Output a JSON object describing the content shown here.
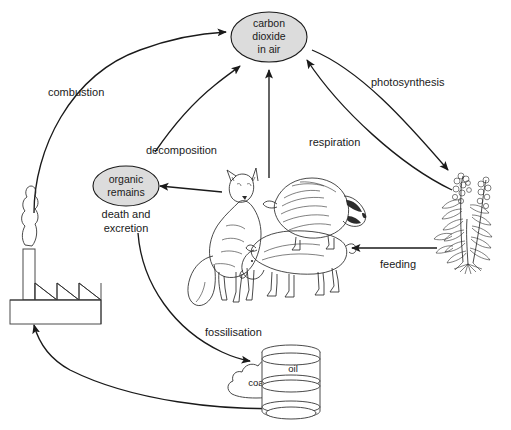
{
  "diagram": {
    "type": "cycle-diagram",
    "canvas": {
      "width": 511,
      "height": 430,
      "background": "#ffffff"
    },
    "colors": {
      "node_fill": "#dcdcdc",
      "stroke": "#1a1a1a",
      "artwork_stroke": "#2b2b2b",
      "object_fill": "#ffffff"
    }
  },
  "nodes": {
    "carbon_dioxide": {
      "line1": "carbon",
      "line2": "dioxide",
      "line3": "in air",
      "shape": "ellipse"
    },
    "organic_remains": {
      "line1": "organic",
      "line2": "remains",
      "shape": "ellipse"
    }
  },
  "labels": {
    "combustion": "combustion",
    "decomposition": "decomposition",
    "photosynthesis": "photosynthesis",
    "respiration": "respiration",
    "feeding": "feeding",
    "fossilisation": "fossilisation",
    "death_line1": "death and",
    "death_line2": "excretion"
  },
  "objects": {
    "factory": {
      "name": "factory",
      "parts": [
        "smoke-plume",
        "chimney",
        "sawtooth-roof",
        "building"
      ]
    },
    "plant": {
      "name": "flowering-plant"
    },
    "animals": {
      "name": "animal-group",
      "members": [
        "fox",
        "badger",
        "pig"
      ]
    },
    "fossil_fuels": {
      "oil_barrel_label": "oil",
      "coal_label": "coal"
    }
  },
  "flows": [
    {
      "id": "combustion",
      "from": "factory",
      "to": "carbon_dioxide",
      "label": "combustion",
      "style": "curved"
    },
    {
      "id": "decomposition",
      "from": "organic_remains",
      "to": "carbon_dioxide",
      "label": "decomposition",
      "style": "curved"
    },
    {
      "id": "respiration",
      "from": "animals",
      "to": "carbon_dioxide",
      "label": "respiration",
      "style": "straight"
    },
    {
      "id": "photosynthesis",
      "from": "carbon_dioxide",
      "to": "plant",
      "label": "photosynthesis",
      "style": "curved"
    },
    {
      "id": "plant_respiration",
      "from": "plant",
      "to": "carbon_dioxide",
      "label": "respiration",
      "style": "curved"
    },
    {
      "id": "feeding",
      "from": "plant",
      "to": "animals",
      "label": "feeding",
      "style": "straight"
    },
    {
      "id": "death_excretion",
      "from": "animals",
      "to": "organic_remains",
      "label": "death and excretion",
      "style": "straight"
    },
    {
      "id": "fossilisation",
      "from": "organic_remains",
      "to": "fossil_fuels",
      "label": "fossilisation",
      "style": "curved"
    },
    {
      "id": "fuel_to_factory",
      "from": "fossil_fuels",
      "to": "factory",
      "label": "",
      "style": "curved"
    }
  ]
}
